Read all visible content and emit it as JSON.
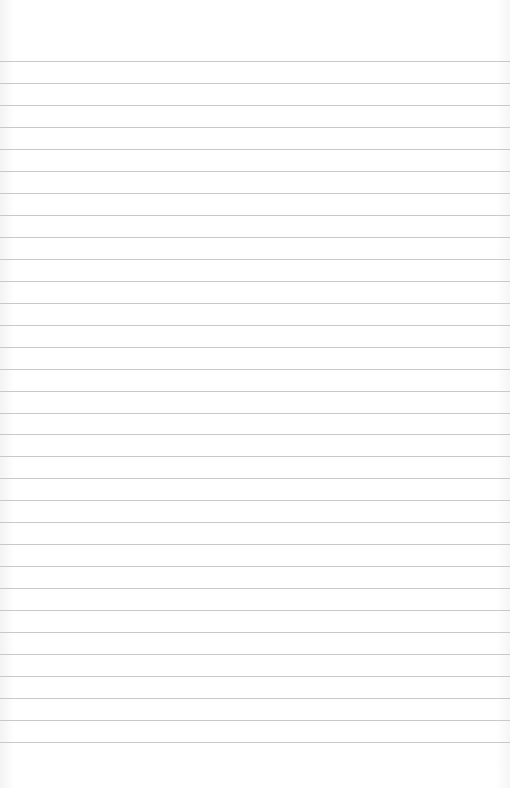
{
  "paper": {
    "type": "lined-paper",
    "background_color": "#ffffff",
    "line_color": "#c9c9c9",
    "first_line_y": 61,
    "line_spacing": 21.97,
    "line_count": 32
  }
}
